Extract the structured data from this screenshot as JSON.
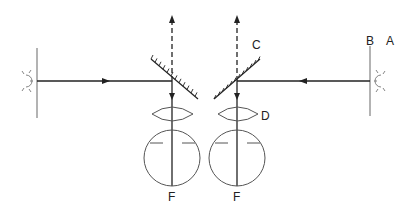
{
  "diagram": {
    "title": "",
    "labels": {
      "A": "A",
      "B": "B",
      "C": "C",
      "D": "D",
      "F_left": "F",
      "F_right": "F"
    },
    "components": [
      {
        "id": "light-source-left",
        "type": "light-source"
      },
      {
        "id": "screen-left",
        "type": "wall"
      },
      {
        "id": "mirror-left",
        "type": "mirror"
      },
      {
        "id": "lens-left",
        "type": "lens"
      },
      {
        "id": "eye-left",
        "type": "eyeball"
      },
      {
        "id": "light-source-right",
        "type": "light-source",
        "label": "A"
      },
      {
        "id": "screen-right",
        "type": "wall",
        "label": "B"
      },
      {
        "id": "mirror-right",
        "type": "mirror",
        "label": "C"
      },
      {
        "id": "lens-right",
        "type": "lens",
        "label": "D"
      },
      {
        "id": "eye-right",
        "type": "eyeball",
        "label": "F"
      }
    ],
    "colors": {
      "line": "#222222",
      "wall": "#9a9a9a",
      "outline": "#555555"
    }
  }
}
